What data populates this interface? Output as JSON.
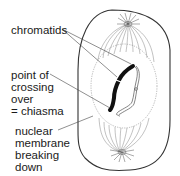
{
  "diagram": {
    "title": "",
    "labels": {
      "chromatids": {
        "lines": [
          "chromatids"
        ]
      },
      "chiasma": {
        "lines": [
          "point of",
          "crossing",
          "over",
          "= chiasma"
        ]
      },
      "nuclear_membrane": {
        "lines": [
          "nuclear",
          "membrane",
          "breaking",
          "down"
        ]
      }
    },
    "colors": {
      "outline": "#333333",
      "spindle": "#777777",
      "chromatid_dark": "#111111",
      "nucleus_dashed": "#999999",
      "background": "#ffffff"
    }
  }
}
